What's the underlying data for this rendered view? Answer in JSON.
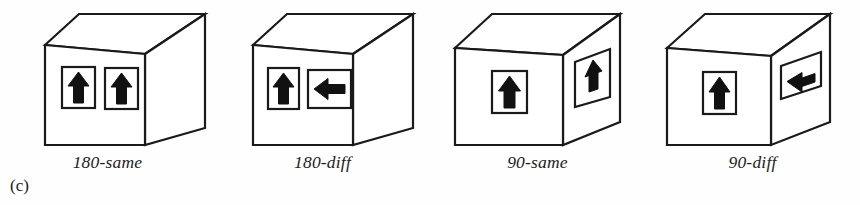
{
  "figure": {
    "subfigure_label": "(c)",
    "background_color": "#fefefe",
    "line_color": "#1a1a1a",
    "fill_color": "#ffffff",
    "arrow_color": "#111111"
  },
  "panels": [
    {
      "id": "panel-180-same",
      "caption": "180-same",
      "box": {
        "orientation": "oblique-right",
        "front_face_width": "wide",
        "side_face_visible": "right"
      },
      "symbols": [
        {
          "face": "front",
          "position": "left",
          "arrow": "up",
          "frame": "portrait"
        },
        {
          "face": "front",
          "position": "right",
          "arrow": "up",
          "frame": "portrait"
        }
      ]
    },
    {
      "id": "panel-180-diff",
      "caption": "180-diff",
      "box": {
        "orientation": "oblique-right",
        "front_face_width": "wide",
        "side_face_visible": "right"
      },
      "symbols": [
        {
          "face": "front",
          "position": "left",
          "arrow": "up",
          "frame": "portrait"
        },
        {
          "face": "front",
          "position": "right",
          "arrow": "left",
          "frame": "landscape"
        }
      ]
    },
    {
      "id": "panel-90-same",
      "caption": "90-same",
      "box": {
        "orientation": "oblique-right",
        "front_face_width": "narrow",
        "side_face_visible": "right"
      },
      "symbols": [
        {
          "face": "front",
          "position": "center",
          "arrow": "up",
          "frame": "portrait"
        },
        {
          "face": "side",
          "position": "center",
          "arrow": "up",
          "frame": "portrait-skewed"
        }
      ]
    },
    {
      "id": "panel-90-diff",
      "caption": "90-diff",
      "box": {
        "orientation": "oblique-right",
        "front_face_width": "narrow",
        "side_face_visible": "right"
      },
      "symbols": [
        {
          "face": "front",
          "position": "center",
          "arrow": "up",
          "frame": "portrait"
        },
        {
          "face": "side",
          "position": "center",
          "arrow": "left",
          "frame": "landscape-skewed"
        }
      ]
    }
  ]
}
